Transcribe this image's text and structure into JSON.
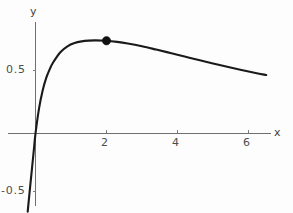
{
  "chart_data": {
    "type": "line",
    "title": "",
    "subtitle": "",
    "xlabel": "x",
    "ylabel": "y",
    "xlim": [
      -0.25,
      6.6
    ],
    "ylim": [
      -0.62,
      0.82
    ],
    "grid": false,
    "legend": null,
    "x_ticks": [
      2,
      4,
      6
    ],
    "x_tick_labels": [
      "2",
      "4",
      "6"
    ],
    "y_ticks": [
      0.5,
      -0.5
    ],
    "y_tick_labels": [
      "0.5",
      "-0.5"
    ],
    "series": [
      {
        "name": "curve",
        "color": "#1a1a1a",
        "x": [
          -0.22,
          -0.15,
          -0.1,
          -0.05,
          0.0,
          0.1,
          0.2,
          0.3,
          0.4,
          0.5,
          0.7,
          0.9,
          1.1,
          1.3,
          1.5,
          1.7,
          2.0,
          2.3,
          2.6,
          3.0,
          3.4,
          3.8,
          4.2,
          4.6,
          5.0,
          5.4,
          5.8,
          6.2,
          6.5
        ],
        "y": [
          -0.62,
          -0.42,
          -0.28,
          -0.14,
          0.0,
          0.2,
          0.34,
          0.44,
          0.51,
          0.565,
          0.645,
          0.692,
          0.718,
          0.731,
          0.737,
          0.739,
          0.736,
          0.727,
          0.714,
          0.692,
          0.666,
          0.639,
          0.611,
          0.583,
          0.556,
          0.529,
          0.504,
          0.48,
          0.464
        ]
      }
    ],
    "annotations": [
      {
        "name": "maximum-point",
        "type": "point-marker",
        "x": 2,
        "y": 0.736,
        "color": "#111111",
        "radius": 4.2
      }
    ],
    "axes": {
      "x_axis_at_y": 0,
      "y_axis_at_x": 0,
      "axis_color": "#6f7170"
    }
  },
  "labels": {
    "y_axis_name": "y",
    "x_axis_name": "x",
    "y_tick_half": "0.5",
    "y_tick_neg_half": "-0.5",
    "x_tick_2": "2",
    "x_tick_4": "4",
    "x_tick_6": "6"
  },
  "colors": {
    "background": "#fdfdfd",
    "curve": "#1a1a1a",
    "axis": "#6f7170",
    "text": "#4c4e4d",
    "marker": "#111111"
  }
}
